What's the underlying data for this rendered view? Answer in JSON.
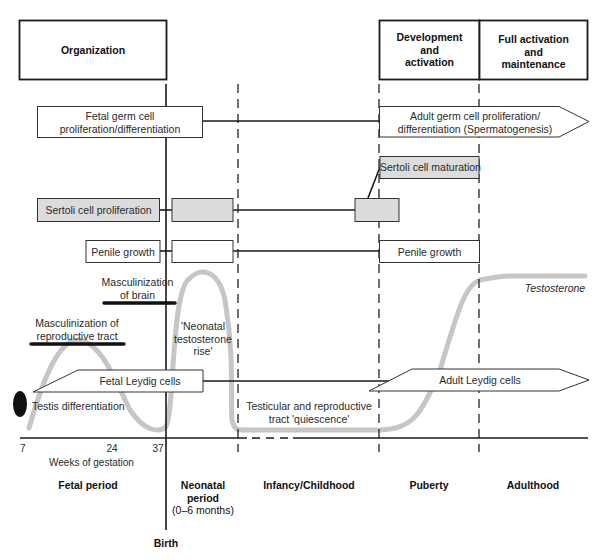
{
  "phases_top": {
    "organization": "Organization",
    "development_l1": "Development",
    "development_l2": "and",
    "development_l3": "activation",
    "full_l1": "Full activation",
    "full_l2": "and",
    "full_l3": "maintenance"
  },
  "processes": {
    "fetal_germ_l1": "Fetal germ cell",
    "fetal_germ_l2": "proliferation/differentiation",
    "adult_germ_l1": "Adult germ cell proliferation/",
    "adult_germ_l2": "differentiation (Spermatogenesis)",
    "sertoli_maturation": "Sertoli cell maturation",
    "sertoli_proliferation": "Sertoli cell proliferation",
    "penile_growth_fetal": "Penile growth",
    "penile_growth_puberty": "Penile growth",
    "masc_brain_l1": "Masculinization",
    "masc_brain_l2": "of brain",
    "masc_repro_l1": "Masculinization of",
    "masc_repro_l2": "reproductive tract",
    "neonatal_rise_l1": "'Neonatal",
    "neonatal_rise_l2": "testosterone",
    "neonatal_rise_l3": "rise'",
    "testosterone": "Testosterone",
    "fetal_leydig": "Fetal Leydig cells",
    "adult_leydig": "Adult Leydig cells",
    "testis_diff": "Testis differentiation",
    "quiescence_l1": "Testicular and reproductive",
    "quiescence_l2": "tract 'quiescence'"
  },
  "axis": {
    "ticks": [
      "7",
      "24",
      "37"
    ],
    "label": "Weeks of gestation"
  },
  "periods": {
    "fetal": "Fetal period",
    "neonatal_l1": "Neonatal",
    "neonatal_l2": "period",
    "neonatal_l3": "(0–6 months)",
    "infancy": "Infancy/Childhood",
    "puberty": "Puberty",
    "adulthood": "Adulthood",
    "birth": "Birth"
  },
  "colors": {
    "line": "#1a1a1a",
    "curve": "#c4c4c4",
    "gray_box": "#dcdcdc",
    "oval": "#111111"
  }
}
